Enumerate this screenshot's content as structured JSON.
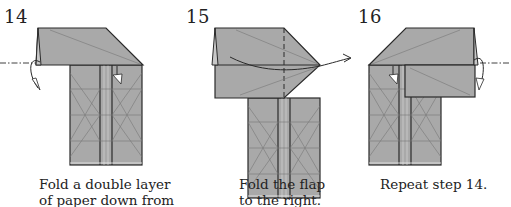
{
  "colors": {
    "paper": "#a9a9a9",
    "paper_light": "#b8b8b8",
    "outline": "#2a2a2a",
    "crease": "#7a7a7a",
    "background": "#ffffff"
  },
  "steps": [
    {
      "number": "14",
      "caption_line1": "Fold a double layer",
      "caption_line2": "of paper down from"
    },
    {
      "number": "15",
      "caption_line1": "Fold the flap",
      "caption_line2": "to the right."
    },
    {
      "number": "16",
      "caption_line1": "Repeat step 14.",
      "caption_line2": ""
    }
  ]
}
